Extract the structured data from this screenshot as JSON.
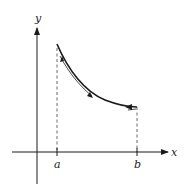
{
  "diagram": {
    "axes": {
      "x_label": "x",
      "y_label": "y"
    },
    "ticks": [
      {
        "label": "a"
      },
      {
        "label": "b"
      }
    ],
    "curve": {
      "description": "decreasing curve from (a, high) to (b, low) with direction arrows",
      "arrows": [
        "up-left near a",
        "down-right at middle",
        "left near b"
      ]
    },
    "colors": {
      "line": "#1a1a1a",
      "dashed": "#444444",
      "background": "#ffffff"
    }
  }
}
